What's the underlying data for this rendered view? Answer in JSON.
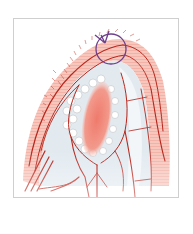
{
  "figure": {
    "type": "anatomical-vascular-illustration",
    "frame": {
      "x": 13,
      "y": 18,
      "width": 166,
      "height": 180,
      "border_color": "#cfcfcf"
    },
    "colors": {
      "vessel": "#b8261c",
      "tissue_outer": "#f4b0a2",
      "tissue_inner": "#dfe8ef",
      "core": "#ee7f72",
      "annotation_circle": "#6e3f8a",
      "background": "#ffffff"
    },
    "annotation": {
      "shape": "circle-with-arrow",
      "center": [
        110,
        48
      ],
      "radius": 16
    }
  }
}
